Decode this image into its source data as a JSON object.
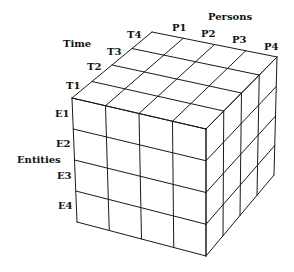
{
  "diagram": {
    "type": "data-cube",
    "grid_size": 4,
    "axes": {
      "persons": {
        "title": "Persons",
        "labels": [
          "P1",
          "P2",
          "P3",
          "P4"
        ]
      },
      "time": {
        "title": "Time",
        "labels": [
          "T1",
          "T2",
          "T3",
          "T4"
        ]
      },
      "entities": {
        "title": "Entities",
        "labels": [
          "E1",
          "E2",
          "E3",
          "E4"
        ]
      }
    },
    "colors": {
      "line": "#1a1a1a",
      "background": "#ffffff",
      "text": "#111111"
    }
  }
}
